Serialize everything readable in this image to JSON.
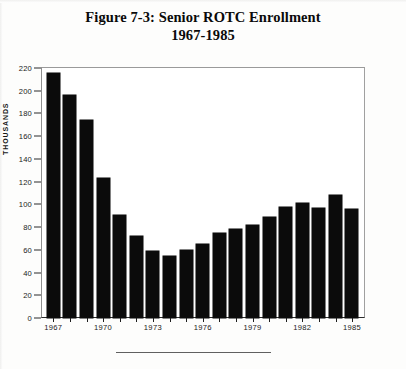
{
  "figure": {
    "title_line1": "Figure 7-3: Senior ROTC Enrollment",
    "title_line2": "1967-1985"
  },
  "chart_data": {
    "type": "bar",
    "title": "Figure 7-3: Senior ROTC Enrollment 1967-1985",
    "xlabel": "",
    "ylabel": "THOUSANDS",
    "ylim": [
      0,
      220
    ],
    "ytick_step": 20,
    "yticks": [
      0,
      20,
      40,
      60,
      80,
      100,
      120,
      140,
      160,
      180,
      200,
      220
    ],
    "grid": false,
    "legend": null,
    "bar_color": "#0b0b0b",
    "categories": [
      "1967",
      "1968",
      "1969",
      "1970",
      "1971",
      "1972",
      "1973",
      "1974",
      "1975",
      "1976",
      "1977",
      "1978",
      "1979",
      "1980",
      "1981",
      "1982",
      "1983",
      "1984",
      "1985"
    ],
    "values": [
      216,
      196,
      174,
      123,
      91,
      72,
      59,
      55,
      60,
      65,
      75,
      78,
      82,
      89,
      98,
      101,
      97,
      108,
      96
    ],
    "xtick_labels": [
      "1967",
      "1970",
      "1973",
      "1976",
      "1979",
      "1982",
      "1985"
    ],
    "xtick_categories": [
      "1967",
      "1970",
      "1973",
      "1976",
      "1979",
      "1982",
      "1985"
    ]
  },
  "axis": {
    "y_title": "THOUSANDS"
  }
}
